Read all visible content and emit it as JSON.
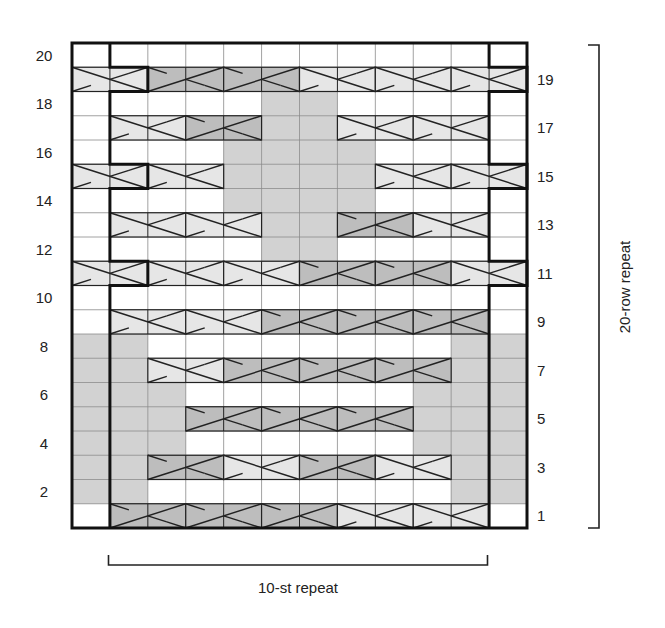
{
  "chart_data": {
    "type": "knitting-chart",
    "title": "",
    "columns": 12,
    "rows": 20,
    "cell_types": {
      "blank": "knit (white)",
      "purl": "shaded (gray)",
      "light_cross": "2-st cable, light shade, right-leaning over",
      "dark_cross": "2-st cable, dark shade, left-leaning over"
    },
    "colors": {
      "blank": "#ffffff",
      "purl": "#d2d2d2",
      "light_cross": "#e6e6e6",
      "dark_cross": "#bdbdbd",
      "grid": "#8a8a8a",
      "outline": "#111111"
    },
    "row_labels_left": [
      "2",
      "4",
      "6",
      "8",
      "10",
      "12",
      "14",
      "16",
      "18",
      "20"
    ],
    "row_labels_right": [
      "1",
      "3",
      "5",
      "7",
      "9",
      "11",
      "13",
      "15",
      "17",
      "19"
    ],
    "purl_cells": [
      {
        "row": 2,
        "cols": [
          0,
          1,
          10,
          11
        ]
      },
      {
        "row": 3,
        "cols": [
          0,
          1,
          10,
          11
        ]
      },
      {
        "row": 4,
        "cols": [
          0,
          1,
          2,
          9,
          10,
          11
        ]
      },
      {
        "row": 5,
        "cols": [
          0,
          1,
          2,
          9,
          10,
          11
        ]
      },
      {
        "row": 6,
        "cols": [
          0,
          1,
          2,
          9,
          10,
          11
        ]
      },
      {
        "row": 7,
        "cols": [
          0,
          1,
          10,
          11
        ]
      },
      {
        "row": 8,
        "cols": [
          0,
          1,
          10,
          11
        ]
      },
      {
        "row": 12,
        "cols": [
          5,
          6
        ]
      },
      {
        "row": 13,
        "cols": [
          5,
          6
        ]
      },
      {
        "row": 14,
        "cols": [
          4,
          5,
          6,
          7
        ]
      },
      {
        "row": 15,
        "cols": [
          4,
          5,
          6,
          7
        ]
      },
      {
        "row": 16,
        "cols": [
          4,
          5,
          6,
          7
        ]
      },
      {
        "row": 17,
        "cols": [
          5,
          6
        ]
      },
      {
        "row": 18,
        "cols": [
          5,
          6
        ]
      }
    ],
    "cables": [
      {
        "row": 1,
        "start": 1,
        "type": "dark"
      },
      {
        "row": 1,
        "start": 3,
        "type": "dark"
      },
      {
        "row": 1,
        "start": 5,
        "type": "dark"
      },
      {
        "row": 1,
        "start": 7,
        "type": "light"
      },
      {
        "row": 1,
        "start": 9,
        "type": "light"
      },
      {
        "row": 3,
        "start": 2,
        "type": "dark"
      },
      {
        "row": 3,
        "start": 4,
        "type": "light"
      },
      {
        "row": 3,
        "start": 6,
        "type": "dark"
      },
      {
        "row": 3,
        "start": 8,
        "type": "light"
      },
      {
        "row": 5,
        "start": 3,
        "type": "dark"
      },
      {
        "row": 5,
        "start": 5,
        "type": "dark"
      },
      {
        "row": 5,
        "start": 7,
        "type": "dark"
      },
      {
        "row": 7,
        "start": 2,
        "type": "light"
      },
      {
        "row": 7,
        "start": 4,
        "type": "dark"
      },
      {
        "row": 7,
        "start": 6,
        "type": "dark"
      },
      {
        "row": 7,
        "start": 8,
        "type": "dark"
      },
      {
        "row": 9,
        "start": 1,
        "type": "light"
      },
      {
        "row": 9,
        "start": 3,
        "type": "light"
      },
      {
        "row": 9,
        "start": 5,
        "type": "dark"
      },
      {
        "row": 9,
        "start": 7,
        "type": "dark"
      },
      {
        "row": 9,
        "start": 9,
        "type": "dark"
      },
      {
        "row": 11,
        "start": 0,
        "type": "light"
      },
      {
        "row": 11,
        "start": 2,
        "type": "light"
      },
      {
        "row": 11,
        "start": 4,
        "type": "light"
      },
      {
        "row": 11,
        "start": 6,
        "type": "dark"
      },
      {
        "row": 11,
        "start": 8,
        "type": "dark"
      },
      {
        "row": 11,
        "start": 10,
        "type": "light"
      },
      {
        "row": 13,
        "start": 1,
        "type": "light"
      },
      {
        "row": 13,
        "start": 3,
        "type": "light"
      },
      {
        "row": 13,
        "start": 7,
        "type": "dark"
      },
      {
        "row": 13,
        "start": 9,
        "type": "light"
      },
      {
        "row": 15,
        "start": 0,
        "type": "light"
      },
      {
        "row": 15,
        "start": 2,
        "type": "light"
      },
      {
        "row": 15,
        "start": 8,
        "type": "light"
      },
      {
        "row": 15,
        "start": 10,
        "type": "light"
      },
      {
        "row": 17,
        "start": 1,
        "type": "light"
      },
      {
        "row": 17,
        "start": 3,
        "type": "dark"
      },
      {
        "row": 17,
        "start": 7,
        "type": "light"
      },
      {
        "row": 17,
        "start": 9,
        "type": "light"
      },
      {
        "row": 19,
        "start": 0,
        "type": "light"
      },
      {
        "row": 19,
        "start": 2,
        "type": "dark"
      },
      {
        "row": 19,
        "start": 4,
        "type": "dark"
      },
      {
        "row": 19,
        "start": 6,
        "type": "light"
      },
      {
        "row": 19,
        "start": 8,
        "type": "light"
      },
      {
        "row": 19,
        "start": 10,
        "type": "light"
      }
    ],
    "repeat_boundary": {
      "left_col_default": 1,
      "left_col_jog": 2,
      "right_col_default": 11,
      "right_col_jog": 12,
      "jog_rows": [
        11,
        15,
        19
      ]
    },
    "stitch_repeat_label": "10-st repeat",
    "row_repeat_label": "20-row repeat"
  }
}
